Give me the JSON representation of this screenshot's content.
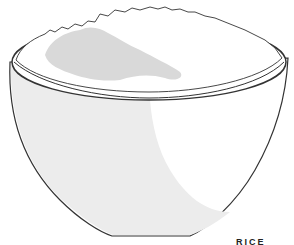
{
  "illustration": {
    "subject": "bowl of rice",
    "caption": "RICE",
    "colors": {
      "background": "#ffffff",
      "outline": "#333333",
      "bowl_shadow": "#ececec",
      "rice_shadow": "#d9d9d9"
    }
  }
}
